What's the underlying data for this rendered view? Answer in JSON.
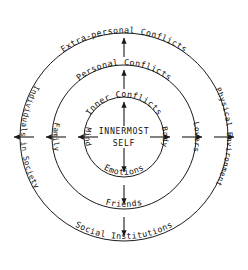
{
  "diagram": {
    "title": "INNERMOST SELF",
    "type": "concentric-circles",
    "center": {
      "line1": "INNERMOST",
      "line2": "SELF"
    },
    "rings": [
      {
        "index": 0,
        "name": "inner-conflicts",
        "top_label": "Inner Conflicts",
        "bottom_label": "Emotions",
        "left_label": "Mind",
        "right_label": "Body",
        "radius": 40
      },
      {
        "index": 1,
        "name": "personal-conflicts",
        "top_label": "Personal Conflicts",
        "bottom_label": "Friends",
        "left_label": "Family",
        "right_label": "Lovers",
        "radius": 72
      },
      {
        "index": 2,
        "name": "extra-personal-conflicts",
        "top_label": "Extra-personal Conflicts",
        "bottom_label": "Social Institutions",
        "left_label": "Individuals in Society",
        "right_label": "Physical Environment",
        "radius": 104
      }
    ],
    "arrows": {
      "directions": [
        "up",
        "down",
        "left",
        "right"
      ],
      "count_per_direction": 3,
      "description": "arrows radiate outward from the innermost self through each ring"
    },
    "colors": {
      "stroke": "#1a1a1a",
      "text": "#111111",
      "background": "#ffffff"
    }
  }
}
